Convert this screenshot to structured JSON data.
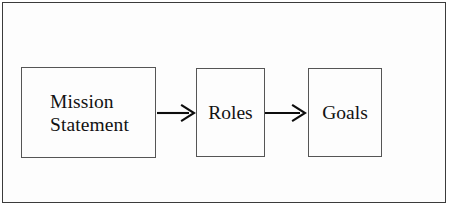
{
  "figure": {
    "type": "flow-diagram",
    "orientation": "left-to-right",
    "frame": {
      "visible": true,
      "border_color": "#3b3b3b",
      "background_color": "#fdfdfd"
    },
    "nodes": [
      {
        "id": "mission",
        "label": "Mission\nStatement",
        "shape": "rectangle",
        "border_color": "#555555",
        "fill_color": "#fdfdfd",
        "text_color": "#121212"
      },
      {
        "id": "roles",
        "label": "Roles",
        "shape": "rectangle",
        "border_color": "#555555",
        "fill_color": "#fdfdfd",
        "text_color": "#121212"
      },
      {
        "id": "goals",
        "label": "Goals",
        "shape": "rectangle",
        "border_color": "#555555",
        "fill_color": "#fdfdfd",
        "text_color": "#121212"
      }
    ],
    "connectors": [
      {
        "id": "arrow-1",
        "from": "mission",
        "to": "roles",
        "style": "open-arrow",
        "color": "#0d0d0d",
        "label": ""
      },
      {
        "id": "arrow-2",
        "from": "roles",
        "to": "goals",
        "style": "open-arrow",
        "color": "#0d0d0d",
        "label": ""
      }
    ]
  }
}
